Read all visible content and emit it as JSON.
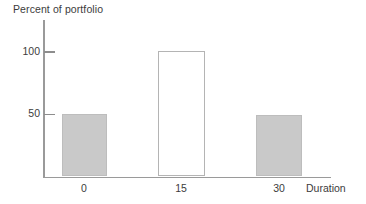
{
  "chart_data": {
    "type": "bar",
    "title": "",
    "subtitle": "",
    "xlabel": "Duration",
    "ylabel": "Percent of portfolio",
    "categories": [
      "0",
      "15",
      "30"
    ],
    "values": [
      50,
      100,
      49
    ],
    "series": [
      {
        "name": "Percent of portfolio",
        "values": [
          50,
          100,
          49
        ]
      }
    ],
    "xlim": [
      -7.5,
      37.5
    ],
    "ylim": [
      0,
      125
    ],
    "y_ticks": [
      "50",
      "100"
    ],
    "y_tick_values": [
      50,
      100
    ],
    "x_ticks": [
      "0",
      "15",
      "30"
    ],
    "x_tick_values": [
      0,
      15,
      30
    ],
    "grid": false,
    "legend": null,
    "legend_position": "none",
    "bar_styles": [
      {
        "category": "0",
        "fill": "#c9c9c9",
        "stroke": "#bdbdbd",
        "filled": true
      },
      {
        "category": "15",
        "fill": "#ffffff",
        "stroke": "#b4b4b4",
        "filled": false
      },
      {
        "category": "30",
        "fill": "#c9c9c9",
        "stroke": "#bdbdbd",
        "filled": true
      }
    ],
    "annotations": []
  },
  "axes": {
    "y_title": "Percent of portfolio",
    "x_title": "Duration",
    "y_tick_labels": {
      "t100": "100",
      "t50": "50"
    },
    "x_tick_labels": {
      "t0": "0",
      "t15": "15",
      "t30": "30"
    }
  },
  "colors": {
    "bar_fill": "#c9c9c9",
    "bar_stroke": "#bdbdbd",
    "hollow_bar_stroke": "#b4b4b4",
    "axis_line": "#9a9a9a",
    "tick_mark": "#8d8d8d",
    "text": "#3c3c3c",
    "background": "#ffffff"
  }
}
